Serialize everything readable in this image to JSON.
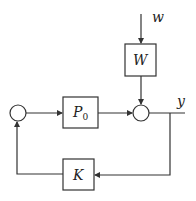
{
  "diagram": {
    "type": "block-diagram",
    "colors": {
      "stroke": "#333333",
      "background": "#ffffff",
      "text": "#222222"
    },
    "blocks": [
      {
        "id": "W",
        "label": "W",
        "x": 125,
        "y": 44,
        "w": 31,
        "h": 32
      },
      {
        "id": "P0",
        "label": "P",
        "subscript": "0",
        "x": 63,
        "y": 97,
        "w": 35,
        "h": 31
      },
      {
        "id": "K",
        "label": "K",
        "x": 63,
        "y": 159,
        "w": 31,
        "h": 31
      }
    ],
    "summing_junctions": [
      {
        "id": "sum_left",
        "cx": 18,
        "cy": 113,
        "r": 8
      },
      {
        "id": "sum_right",
        "cx": 141,
        "cy": 113,
        "r": 8
      }
    ],
    "signals": {
      "input": "w",
      "output": "y"
    },
    "connections": [
      {
        "from": "w",
        "to": "W"
      },
      {
        "from": "W",
        "to": "sum_right"
      },
      {
        "from": "sum_left",
        "to": "P0"
      },
      {
        "from": "P0",
        "to": "sum_right"
      },
      {
        "from": "sum_right",
        "to": "y"
      },
      {
        "from": "y",
        "to": "K"
      },
      {
        "from": "K",
        "to": "sum_left"
      }
    ]
  }
}
